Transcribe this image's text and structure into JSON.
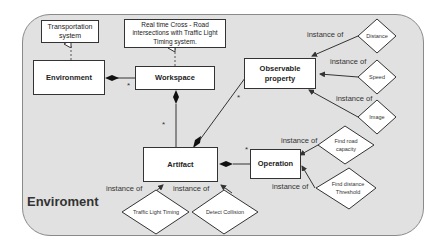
{
  "diagram": {
    "frame_title": "Enviroment",
    "classes": {
      "transportation": "Transportation system",
      "realtime": "Real time Cross - Road intersections with Traffic Light Timing system.",
      "environment": "Environment",
      "workspace": "Workspace",
      "observable": "Observable property",
      "artifact": "Artifact",
      "operation": "Operation"
    },
    "instances": {
      "distance": "Distance",
      "speed": "Speed",
      "image": "Image",
      "find_road_capacity": "Find road capacity",
      "find_distance_threshold": "Find distance Threshold",
      "traffic_light_timing": "Traffic Light Timing",
      "detect_collision": "Detect Collision"
    },
    "relation_label": "instance of",
    "multiplicity": "*"
  }
}
